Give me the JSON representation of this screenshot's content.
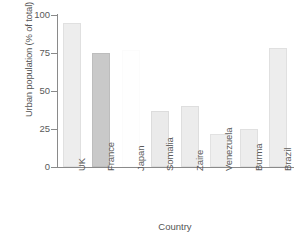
{
  "chart_data": {
    "type": "bar",
    "title": "",
    "xlabel": "Country",
    "ylabel": "Urban population (% of total)",
    "categories": [
      "UK",
      "France",
      "Japan",
      "Somalia",
      "Zaire",
      "Venezuela",
      "Burma",
      "Brazil"
    ],
    "values": [
      95,
      75,
      77,
      37,
      40,
      22,
      25,
      78
    ],
    "bar_colors": [
      "#ededed",
      "#c9c9c9",
      "#fefefe",
      "#eaeaea",
      "#ececec",
      "#efefef",
      "#ededed",
      "#ededed"
    ],
    "bar_borders": [
      "#e0e0e0",
      "#bdbdbd",
      "#fbfbfb",
      "#dcdcdc",
      "#dedede",
      "#e2e2e2",
      "#e0e0e0",
      "#e0e0e0"
    ],
    "ylim": [
      0,
      100
    ],
    "yticks": [
      0,
      25,
      50,
      75,
      100
    ],
    "ytick_labels": [
      "0",
      "25",
      "50",
      "75",
      "100"
    ],
    "xtick_labels": [
      "UK",
      "France",
      "Japan",
      "Somalia",
      "Zaire",
      "Venezuela",
      "Burma",
      "Brazil"
    ],
    "grid": false,
    "legend": false,
    "legend_position": "none"
  },
  "axes": {
    "y_title": "Urban population (% of total)",
    "x_title": "Country",
    "axis_color": "#8a8a8a"
  }
}
